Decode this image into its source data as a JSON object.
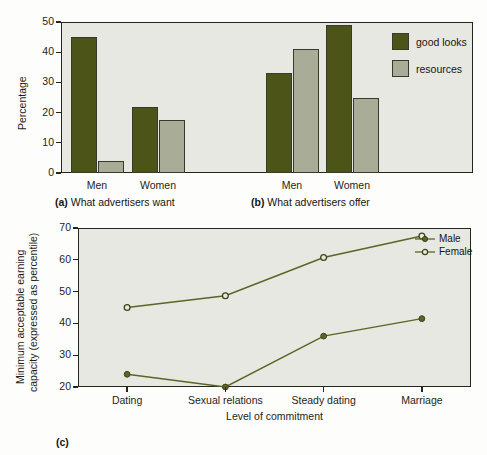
{
  "figure": {
    "background": "#fdfdfc",
    "plot_background": "#e7e8e1",
    "axis_color": "#26261f",
    "colors": {
      "good_looks": "#4c5418",
      "resources": "#a9ac96",
      "line": "#5c6426"
    }
  },
  "panel_a": {
    "caption_tag": "(a)",
    "caption_text": "What advertisers want",
    "ylabel": "Percentage"
  },
  "panel_b": {
    "caption_tag": "(b)",
    "caption_text": "What advertisers offer"
  },
  "panel_c": {
    "caption_tag": "(c)"
  },
  "legend_bar": {
    "items": [
      {
        "label": "good looks",
        "color": "#4c5418"
      },
      {
        "label": "resources",
        "color": "#a9ac96"
      }
    ]
  },
  "legend_line": {
    "items": [
      {
        "label": "Male",
        "marker": "filled-circle-marker",
        "color": "#5c6426"
      },
      {
        "label": "Female",
        "marker": "open-circle-marker",
        "color": "#5c6426"
      }
    ]
  },
  "chart_data": [
    {
      "type": "bar",
      "id": "what-advertisers-want",
      "title": "(a) What advertisers want",
      "xlabel": "",
      "ylabel": "Percentage",
      "ylim": [
        0,
        50
      ],
      "yticks": [
        0,
        10,
        20,
        30,
        40,
        50
      ],
      "grid": false,
      "legend_position": "upper-right-shared",
      "categories": [
        "Men",
        "Women"
      ],
      "series": [
        {
          "name": "good looks",
          "color": "#4c5418",
          "values": [
            45,
            22
          ]
        },
        {
          "name": "resources",
          "color": "#a9ac96",
          "values": [
            4,
            17.7
          ]
        }
      ]
    },
    {
      "type": "bar",
      "id": "what-advertisers-offer",
      "title": "(b) What advertisers offer",
      "xlabel": "",
      "ylabel": "Percentage",
      "ylim": [
        0,
        50
      ],
      "yticks": [
        0,
        10,
        20,
        30,
        40,
        50
      ],
      "grid": false,
      "legend_position": "upper-right-shared",
      "categories": [
        "Men",
        "Women"
      ],
      "series": [
        {
          "name": "good looks",
          "color": "#4c5418",
          "values": [
            33,
            49
          ]
        },
        {
          "name": "resources",
          "color": "#a9ac96",
          "values": [
            41,
            24.8
          ]
        }
      ]
    },
    {
      "type": "line",
      "id": "minimum-acceptable-earning-capacity",
      "title": "(c)",
      "xlabel": "Level of commitment",
      "ylabel": "Minimum acceptable earning capacity (expressed as percentile)",
      "ylim": [
        20,
        70
      ],
      "yticks": [
        20,
        30,
        40,
        50,
        60,
        70
      ],
      "grid": false,
      "legend_position": "upper-right-inside",
      "categories": [
        "Dating",
        "Sexual relations",
        "Steady dating",
        "Marriage"
      ],
      "series": [
        {
          "name": "Male",
          "marker": "filled-circle",
          "color": "#5c6426",
          "values": [
            24,
            20,
            36,
            41.5
          ]
        },
        {
          "name": "Female",
          "marker": "open-circle",
          "color": "#5c6426",
          "values": [
            45,
            48.7,
            60.7,
            67.5
          ]
        }
      ]
    }
  ],
  "axes": {
    "top": {
      "ytick_labels": [
        "50",
        "40",
        "30",
        "20",
        "10",
        "0"
      ],
      "cat_labels": [
        "Men",
        "Women",
        "Men",
        "Women"
      ]
    },
    "bottom": {
      "ytick_labels": [
        "70",
        "60",
        "50",
        "40",
        "30",
        "20"
      ],
      "cat_labels": [
        "Dating",
        "Sexual relations",
        "Steady dating",
        "Marriage"
      ],
      "xlabel": "Level of commitment",
      "ylabel_line1": "Minimum acceptable earning",
      "ylabel_line2": "capacity (expressed as percentile)"
    }
  }
}
